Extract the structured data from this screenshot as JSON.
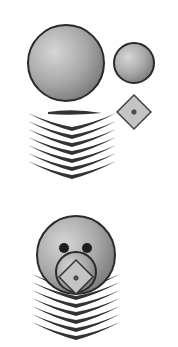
{
  "canvas": {
    "width": 178,
    "height": 347,
    "background": "#ffffff"
  },
  "colors": {
    "fill_light": "#c8c8c8",
    "fill_dark": "#8a8a8a",
    "stroke": "#2a2a2a",
    "feather": "#333333",
    "diamond_fill": "#c4c4c4"
  },
  "figures": [
    {
      "name": "separated-parts",
      "parts": [
        "large-sphere",
        "small-sphere",
        "diamond",
        "feather-stack"
      ]
    },
    {
      "name": "assembled-figure",
      "parts": [
        "head-sphere",
        "ears",
        "face-circle",
        "diamond",
        "feather-stack"
      ]
    }
  ]
}
